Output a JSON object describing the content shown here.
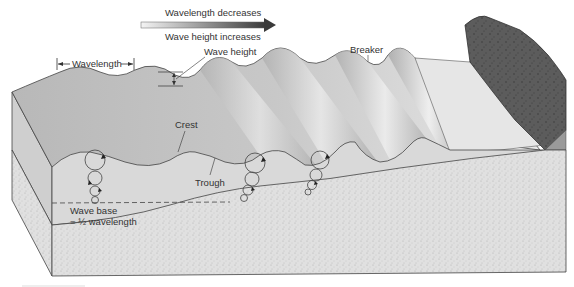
{
  "diagram": {
    "colors": {
      "water_top": "#bdbdbd",
      "water_side": "#d6d6d6",
      "water_light": "#ededed",
      "sediment": "#e2e2e2",
      "rock": "#5a5a5a",
      "outline": "#444444",
      "text": "#333333",
      "arrow_dark": "#3a3a3a"
    },
    "trend_arrow": {
      "top_label": "Wavelength decreases",
      "bottom_label": "Wave height increases"
    },
    "labels": {
      "wavelength": "Wavelength",
      "wave_height": "Wave height",
      "breaker": "Breaker",
      "crest": "Crest",
      "trough": "Trough",
      "wave_base_line1": "Wave base",
      "wave_base_line2": "= ½ wavelength"
    },
    "orbit_columns": [
      {
        "x": 95,
        "circles": [
          {
            "y": 160,
            "r": 10
          },
          {
            "y": 178,
            "r": 7
          },
          {
            "y": 191,
            "r": 5
          },
          {
            "y": 201,
            "r": 3.5
          }
        ]
      },
      {
        "x": 255,
        "circles": [
          {
            "y": 163,
            "r": 10
          },
          {
            "y": 179,
            "r": 7
          },
          {
            "y": 190,
            "r": 5
          },
          {
            "y": 198,
            "r": 3.5
          }
        ]
      },
      {
        "x": 318,
        "circles": [
          {
            "y": 160,
            "r": 9
          },
          {
            "y": 175,
            "r": 6
          },
          {
            "y": 185,
            "r": 4.5
          },
          {
            "y": 192,
            "r": 3
          }
        ]
      }
    ]
  }
}
